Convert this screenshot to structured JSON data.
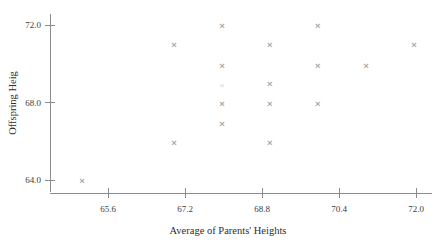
{
  "chart_data": {
    "type": "scatter",
    "title": "",
    "xlabel": "Average of Parents' Heights",
    "ylabel": "Offspring Heig",
    "xlim": [
      64.8,
      73.0
    ],
    "ylim": [
      63.2,
      72.6
    ],
    "xticks": [
      65.6,
      67.2,
      68.8,
      70.4,
      72.0
    ],
    "xtick_labels": [
      "65.6",
      "67.2",
      "68.8",
      "70.4",
      "72.0"
    ],
    "yticks": [
      64.0,
      68.0,
      72.0
    ],
    "ytick_labels": [
      "64.0",
      "68.0",
      "72.0"
    ],
    "grid": false,
    "legend": null,
    "marker": "x",
    "marker_color": "#a8a8a8",
    "points": [
      {
        "x": 65.06,
        "y": 64.0,
        "faint": false
      },
      {
        "x": 66.97,
        "y": 65.95,
        "faint": false
      },
      {
        "x": 66.97,
        "y": 71.0,
        "faint": false
      },
      {
        "x": 67.97,
        "y": 66.9,
        "faint": false
      },
      {
        "x": 67.97,
        "y": 67.95,
        "faint": false
      },
      {
        "x": 67.97,
        "y": 68.9,
        "faint": true
      },
      {
        "x": 67.97,
        "y": 69.9,
        "faint": false
      },
      {
        "x": 67.97,
        "y": 71.95,
        "faint": false
      },
      {
        "x": 68.96,
        "y": 65.95,
        "faint": false
      },
      {
        "x": 68.96,
        "y": 67.95,
        "faint": false
      },
      {
        "x": 68.96,
        "y": 69.0,
        "faint": false
      },
      {
        "x": 68.96,
        "y": 71.0,
        "faint": false
      },
      {
        "x": 69.96,
        "y": 67.95,
        "faint": false
      },
      {
        "x": 69.96,
        "y": 69.9,
        "faint": false
      },
      {
        "x": 69.96,
        "y": 71.95,
        "faint": false
      },
      {
        "x": 70.96,
        "y": 69.9,
        "faint": false
      },
      {
        "x": 71.96,
        "y": 71.0,
        "faint": false
      }
    ]
  }
}
